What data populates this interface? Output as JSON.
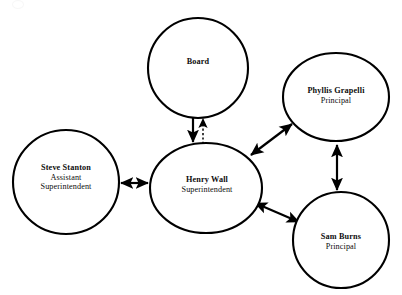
{
  "diagram": {
    "type": "organizational-relationship-diagram",
    "background_color": "#ffffff",
    "stroke_color": "#000000",
    "text_color": "#0d0d0d",
    "nodes": [
      {
        "id": "board",
        "name": "Board",
        "title": "",
        "cx": 198,
        "cy": 68,
        "rx": 50,
        "ry": 50
      },
      {
        "id": "steve-stanton",
        "name": "Steve Stanton",
        "title": "Assistant",
        "title2": "Superintendent",
        "cx": 66,
        "cy": 182,
        "rx": 53,
        "ry": 52
      },
      {
        "id": "henry-wall",
        "name": "Henry Wall",
        "title": "Superintendent",
        "cx": 206,
        "cy": 188,
        "rx": 56,
        "ry": 45
      },
      {
        "id": "phyllis-grapelli",
        "name": "Phyllis Grapelli",
        "title": "Principal",
        "cx": 336,
        "cy": 97,
        "rx": 53,
        "ry": 44
      },
      {
        "id": "sam-burns",
        "name": "Sam Burns",
        "title": "Principal",
        "cx": 341,
        "cy": 240,
        "rx": 48,
        "ry": 48
      }
    ],
    "edges": [
      {
        "id": "board-to-henry-wall",
        "from": "board",
        "to": "henry-wall",
        "style": "solid",
        "arrow": "single-down"
      },
      {
        "id": "henry-wall-to-board",
        "from": "henry-wall",
        "to": "board",
        "style": "dashed",
        "arrow": "single-up"
      },
      {
        "id": "steve-stanton-henry-wall",
        "from": "steve-stanton",
        "to": "henry-wall",
        "style": "solid",
        "arrow": "double"
      },
      {
        "id": "henry-wall-phyllis-grapelli",
        "from": "henry-wall",
        "to": "phyllis-grapelli",
        "style": "solid",
        "arrow": "double"
      },
      {
        "id": "henry-wall-sam-burns",
        "from": "henry-wall",
        "to": "sam-burns",
        "style": "solid",
        "arrow": "double"
      },
      {
        "id": "phyllis-grapelli-sam-burns",
        "from": "phyllis-grapelli",
        "to": "sam-burns",
        "style": "solid",
        "arrow": "double"
      }
    ]
  }
}
